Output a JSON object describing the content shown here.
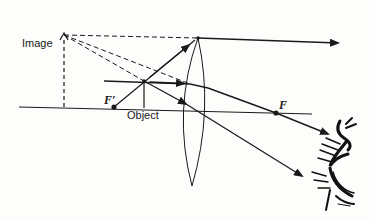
{
  "diagram": {
    "labels": {
      "image": "Image",
      "object": "Object",
      "focal_near": "F′",
      "focal_far": "F"
    },
    "colors": {
      "ink": "#1a1a1a",
      "background": "#fdfdfb"
    },
    "elements": {
      "optical_axis": "horizontal principal axis",
      "lens": "biconvex converging lens",
      "object_arrow": "upright object inside focal length",
      "virtual_image": "enlarged upright virtual image (dashed)",
      "eye": "observer's eye on right"
    }
  }
}
